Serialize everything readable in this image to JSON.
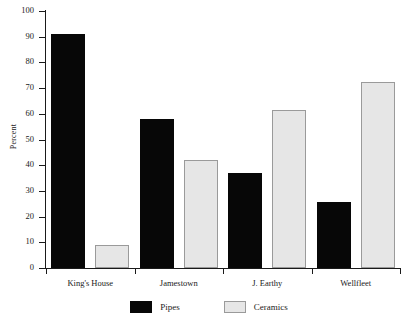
{
  "chart_data": {
    "type": "bar",
    "title": "",
    "subtitle": "",
    "xlabel": "",
    "ylabel": "Percent",
    "categories": [
      "King's House",
      "Jamestown",
      "J. Earthy",
      "Wellfleet"
    ],
    "series": [
      {
        "name": "Pipes",
        "color": "#070707",
        "values": [
          91,
          58,
          37,
          25.5
        ]
      },
      {
        "name": "Ceramics",
        "color": "#e6e6e6",
        "values": [
          9,
          42,
          61.5,
          72.5
        ]
      }
    ],
    "ylim": [
      0,
      100
    ],
    "ytick_values": [
      0,
      10,
      20,
      30,
      40,
      50,
      60,
      70,
      80,
      90,
      100
    ],
    "ytick_labels": [
      "0",
      "10",
      "20",
      "30",
      "40",
      "50",
      "60",
      "70",
      "80",
      "90",
      "100"
    ],
    "grid": false,
    "legend_position": "bottom-center",
    "legend": [
      {
        "label": "Pipes",
        "swatch": "black-filled-square"
      },
      {
        "label": "Ceramics",
        "swatch": "light-gray-square"
      }
    ],
    "axis_style": "left-and-bottom-spines-only"
  }
}
